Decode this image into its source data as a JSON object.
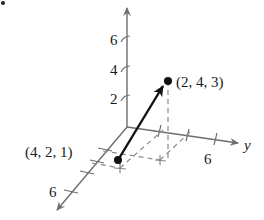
{
  "figure": {
    "type": "3d-vector-diagram",
    "axes": {
      "x": {
        "label": "",
        "ticks": [
          "6"
        ]
      },
      "y": {
        "label": "y",
        "ticks": [
          "6"
        ]
      },
      "z": {
        "label": "",
        "ticks": [
          "2",
          "4",
          "6"
        ]
      }
    },
    "points": [
      {
        "label": "(4, 2, 1)",
        "role": "initial-point"
      },
      {
        "label": "(2, 4, 3)",
        "role": "terminal-point"
      }
    ],
    "colors": {
      "axis": "#6e6e6e",
      "vector": "#111111",
      "dashed": "#8a8a8a"
    }
  }
}
